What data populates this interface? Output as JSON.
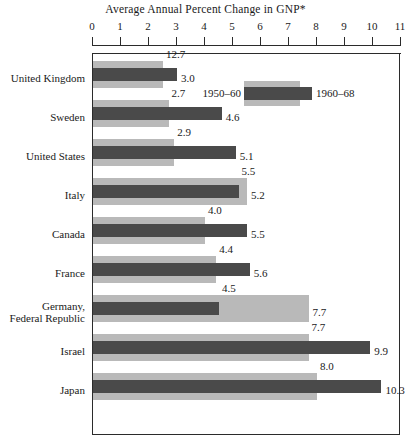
{
  "chart_data": {
    "type": "bar",
    "orientation": "horizontal",
    "title": "Average Annual Percent Change in GNP*",
    "xlabel": "",
    "ylabel": "",
    "xlim": [
      0,
      11
    ],
    "xticks": [
      0,
      1,
      2,
      3,
      4,
      5,
      6,
      7,
      8,
      9,
      10,
      11
    ],
    "xtick_labels": [
      "0",
      "1",
      "2",
      "3",
      "4",
      "5",
      "6",
      "7",
      "8",
      "9",
      "10",
      "11"
    ],
    "grid": false,
    "legend_position": "top-right inside plot",
    "categories": [
      "United Kingdom",
      "Sweden",
      "United States",
      "Italy",
      "Canada",
      "France",
      "Germany, Federal Republic",
      "Israel",
      "Japan"
    ],
    "series": [
      {
        "name": "1950–60",
        "color": "#b9b9b9",
        "values": [
          2.5,
          2.7,
          2.9,
          5.5,
          4.0,
          4.4,
          7.7,
          7.7,
          8.0
        ],
        "value_labels": [
          "12.7",
          "2.7",
          "2.9",
          "5.5",
          "4.0",
          "4.4",
          "7.7",
          "7.7",
          "8.0"
        ]
      },
      {
        "name": "1960–68",
        "color": "#4a4a4a",
        "values": [
          3.0,
          4.6,
          5.1,
          5.2,
          5.5,
          5.6,
          4.5,
          9.9,
          10.3
        ],
        "value_labels": [
          "3.0",
          "4.6",
          "5.1",
          "5.2",
          "5.5",
          "5.6",
          "4.5",
          "9.9",
          "10.3"
        ]
      }
    ]
  },
  "title": "Average Annual Percent Change in GNP*",
  "legend": {
    "left_label": "1950–60",
    "right_label": "1960–68"
  },
  "axis": {
    "ticks": [
      "0",
      "1",
      "2",
      "3",
      "4",
      "5",
      "6",
      "7",
      "8",
      "9",
      "10",
      "11"
    ]
  },
  "rows": [
    {
      "label": "United Kingdom",
      "light_value": 2.5,
      "dark_value": 3.0,
      "top_label": "12.7",
      "right_label": "3.0"
    },
    {
      "label": "Sweden",
      "light_value": 2.7,
      "dark_value": 4.6,
      "top_label": "2.7",
      "right_label": "4.6"
    },
    {
      "label": "United States",
      "light_value": 2.9,
      "dark_value": 5.1,
      "top_label": "2.9",
      "right_label": "5.1"
    },
    {
      "label": "Italy",
      "light_value": 5.5,
      "dark_value": 5.2,
      "top_label": "5.5",
      "right_label": "5.2"
    },
    {
      "label": "Canada",
      "light_value": 4.0,
      "dark_value": 5.5,
      "top_label": "4.0",
      "right_label": "5.5"
    },
    {
      "label": "France",
      "light_value": 4.4,
      "dark_value": 5.6,
      "top_label": "4.4",
      "right_label": "5.6"
    },
    {
      "label": "Germany,\nFederal Republic",
      "light_value": 7.7,
      "dark_value": 4.5,
      "top_label": "4.5",
      "right_label": "7.7"
    },
    {
      "label": "Israel",
      "light_value": 7.7,
      "dark_value": 9.9,
      "top_label": "7.7",
      "right_label": "9.9"
    },
    {
      "label": "Japan",
      "light_value": 8.0,
      "dark_value": 10.3,
      "top_label": "8.0",
      "right_label": "10.3"
    }
  ]
}
